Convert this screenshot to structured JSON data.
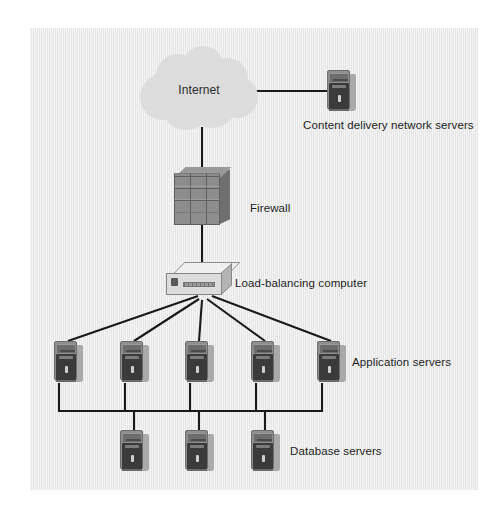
{
  "diagram": {
    "background_color": "#e9e9e9",
    "line_color": "#1a1a1a",
    "nodes": {
      "internet": {
        "label": "Internet",
        "icon": "cloud-icon",
        "x": 199,
        "y": 88
      },
      "cdn": {
        "label": "Content delivery network servers",
        "icon": "server-tower-icon",
        "count": 1,
        "x": 341,
        "y": 91
      },
      "firewall": {
        "label": "Firewall",
        "icon": "brick-wall-icon",
        "x": 202,
        "y": 199
      },
      "load_balancer": {
        "label": "Load-balancing computer",
        "icon": "router-box-icon",
        "x": 202,
        "y": 283
      },
      "application_servers": {
        "label": "Application servers",
        "icon": "server-tower-icon",
        "count": 5,
        "x_positions": [
          68,
          134,
          199,
          265,
          331
        ],
        "y": 348
      },
      "database_servers": {
        "label": "Database servers",
        "icon": "server-tower-icon",
        "count": 3,
        "x_positions": [
          134,
          199,
          265
        ],
        "y": 436
      }
    },
    "labels": {
      "internet": "Internet",
      "cdn": "Content delivery network servers",
      "firewall": "Firewall",
      "load_balancer": "Load-balancing computer",
      "application_servers": "Application servers",
      "database_servers": "Database servers"
    },
    "connections": [
      {
        "from": "internet",
        "to": "cdn",
        "style": "horizontal"
      },
      {
        "from": "internet",
        "to": "firewall",
        "style": "vertical"
      },
      {
        "from": "firewall",
        "to": "load_balancer",
        "style": "vertical"
      },
      {
        "from": "load_balancer",
        "to": "application_servers",
        "style": "fan-out",
        "count": 5
      },
      {
        "from": "application_servers",
        "to": "database_servers",
        "style": "bus",
        "count": 3
      }
    ]
  }
}
